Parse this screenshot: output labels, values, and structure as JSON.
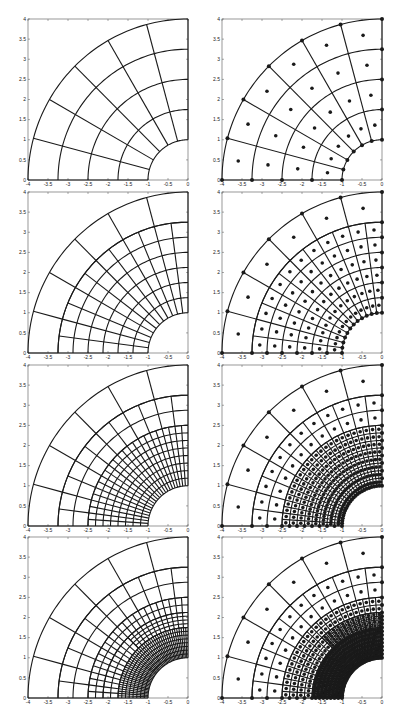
{
  "chart_data": {
    "type": "mesh",
    "layout": {
      "rows": 4,
      "cols": 2
    },
    "axes": {
      "xlim": [
        -4,
        0
      ],
      "ylim": [
        0,
        4
      ],
      "xticks": [
        -4,
        -3.5,
        -3,
        -2.5,
        -2,
        -1.5,
        -1,
        -0.5,
        0
      ],
      "xticklabels": [
        "-4",
        "-3.5",
        "-3",
        "-2.5",
        "-2",
        "-1.5",
        "-1",
        "-0.5",
        "0"
      ],
      "yticks": [
        0,
        0.5,
        1,
        1.5,
        2,
        2.5,
        3,
        3.5,
        4
      ],
      "yticklabels": [
        "0",
        "0.5",
        "1",
        "1.5",
        "2",
        "2.5",
        "3",
        "3.5",
        "4"
      ],
      "grid": false
    },
    "domain": {
      "shape": "quarter-annulus",
      "inner_radius": 1,
      "outer_radius": 4,
      "theta_range_deg": [
        90,
        180
      ]
    },
    "color": "#1a1a1a",
    "panels": [
      {
        "row": 0,
        "col": 0,
        "kind": "mesh",
        "level": 0,
        "regions": [
          {
            "r": [
              1,
              4
            ],
            "nr": 4,
            "nt": 6,
            "theta": [
              90,
              180
            ]
          }
        ]
      },
      {
        "row": 0,
        "col": 1,
        "kind": "mesh+points",
        "level": 0,
        "regions": [
          {
            "r": [
              1,
              4
            ],
            "nr": 4,
            "nt": 6,
            "theta": [
              90,
              180
            ]
          }
        ]
      },
      {
        "row": 1,
        "col": 0,
        "kind": "mesh",
        "level": 1,
        "regions": [
          {
            "r": [
              3.25,
              4
            ],
            "nr": 1,
            "nt": 6,
            "theta": [
              90,
              180
            ]
          },
          {
            "r": [
              1,
              3.25
            ],
            "nr": 6,
            "nt": 12,
            "theta": [
              90,
              180
            ]
          }
        ]
      },
      {
        "row": 1,
        "col": 1,
        "kind": "mesh+points",
        "level": 1,
        "regions": [
          {
            "r": [
              3.25,
              4
            ],
            "nr": 1,
            "nt": 6,
            "theta": [
              90,
              180
            ]
          },
          {
            "r": [
              1,
              3.25
            ],
            "nr": 6,
            "nt": 12,
            "theta": [
              90,
              180
            ]
          }
        ]
      },
      {
        "row": 2,
        "col": 0,
        "kind": "mesh",
        "level": 2,
        "regions": [
          {
            "r": [
              3.25,
              4
            ],
            "nr": 1,
            "nt": 6,
            "theta": [
              90,
              180
            ]
          },
          {
            "r": [
              2.5,
              3.25
            ],
            "nr": 2,
            "nt": 12,
            "theta": [
              90,
              180
            ]
          },
          {
            "r": [
              1,
              2.5
            ],
            "nr": 8,
            "nt": 24,
            "theta": [
              90,
              180
            ]
          }
        ]
      },
      {
        "row": 2,
        "col": 1,
        "kind": "mesh+points",
        "level": 2,
        "regions": [
          {
            "r": [
              3.25,
              4
            ],
            "nr": 1,
            "nt": 6,
            "theta": [
              90,
              180
            ]
          },
          {
            "r": [
              2.5,
              3.25
            ],
            "nr": 2,
            "nt": 12,
            "theta": [
              90,
              180
            ]
          },
          {
            "r": [
              1,
              2.5
            ],
            "nr": 8,
            "nt": 24,
            "theta": [
              90,
              180
            ]
          }
        ]
      },
      {
        "row": 3,
        "col": 0,
        "kind": "mesh",
        "level": 3,
        "regions": [
          {
            "r": [
              3.25,
              4
            ],
            "nr": 1,
            "nt": 6,
            "theta": [
              90,
              180
            ]
          },
          {
            "r": [
              2.5,
              3.25
            ],
            "nr": 2,
            "nt": 12,
            "theta": [
              90,
              180
            ]
          },
          {
            "r": [
              2.125,
              2.5
            ],
            "nr": 2,
            "nt": 24,
            "theta": [
              90,
              180
            ]
          },
          {
            "r": [
              1.75,
              2.125
            ],
            "nr": 2,
            "nt": 24,
            "theta": [
              135,
              180
            ]
          },
          {
            "r": [
              1.75,
              2.125
            ],
            "nr": 4,
            "nt": 24,
            "theta": [
              90,
              135
            ]
          },
          {
            "r": [
              1,
              1.75
            ],
            "nr": 8,
            "nt": 48,
            "theta": [
              90,
              180
            ]
          }
        ]
      },
      {
        "row": 3,
        "col": 1,
        "kind": "mesh+points",
        "level": 3,
        "regions": [
          {
            "r": [
              3.25,
              4
            ],
            "nr": 1,
            "nt": 6,
            "theta": [
              90,
              180
            ]
          },
          {
            "r": [
              2.5,
              3.25
            ],
            "nr": 2,
            "nt": 12,
            "theta": [
              90,
              180
            ]
          },
          {
            "r": [
              2.125,
              2.5
            ],
            "nr": 2,
            "nt": 24,
            "theta": [
              90,
              180
            ]
          },
          {
            "r": [
              1.75,
              2.125
            ],
            "nr": 2,
            "nt": 24,
            "theta": [
              135,
              180
            ]
          },
          {
            "r": [
              1.75,
              2.125
            ],
            "nr": 4,
            "nt": 24,
            "theta": [
              90,
              135
            ]
          },
          {
            "r": [
              1,
              1.75
            ],
            "nr": 8,
            "nt": 48,
            "theta": [
              90,
              180
            ]
          }
        ]
      }
    ]
  }
}
